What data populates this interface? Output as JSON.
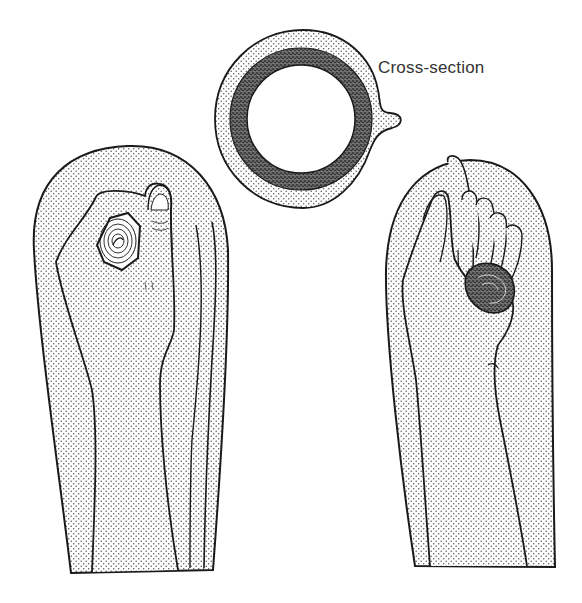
{
  "figure": {
    "cross_section_label": "Cross-section",
    "panels": [
      {
        "id": "left-arm",
        "description": "Hand gripping a coiled object, palm facing viewer, inside a stippled sleeve covering"
      },
      {
        "id": "cross-section",
        "description": "Ring cross-section: stippled outer layer, dark textured middle layer, hollow center, small tab on right"
      },
      {
        "id": "right-arm",
        "description": "Hand viewed from side with fingers curled around a coiled object, inside a stippled sleeve covering"
      }
    ]
  },
  "colors": {
    "background": "#ffffff",
    "outline": "#1a1a1a",
    "stipple_dot": "#555555",
    "dark_layer": "#3a3a3a",
    "label_text": "#333333"
  }
}
